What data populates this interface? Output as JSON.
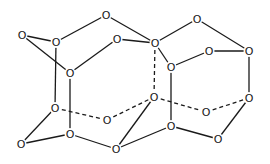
{
  "diagram": {
    "type": "molecular-structure",
    "atom_label": "O",
    "colors": {
      "line": "#1a1a1a",
      "background": "#ffffff"
    },
    "atoms": [
      {
        "id": 0,
        "label": "O",
        "x": 22,
        "y": 35
      },
      {
        "id": 1,
        "label": "O",
        "x": 56,
        "y": 42
      },
      {
        "id": 2,
        "label": "O",
        "x": 106,
        "y": 15
      },
      {
        "id": 3,
        "label": "O",
        "x": 117,
        "y": 39
      },
      {
        "id": 4,
        "label": "O",
        "x": 155,
        "y": 43
      },
      {
        "id": 5,
        "label": "O",
        "x": 197,
        "y": 19
      },
      {
        "id": 6,
        "label": "O",
        "x": 209,
        "y": 51
      },
      {
        "id": 7,
        "label": "O",
        "x": 249,
        "y": 51
      },
      {
        "id": 8,
        "label": "O",
        "x": 70,
        "y": 73
      },
      {
        "id": 9,
        "label": "O",
        "x": 171,
        "y": 67
      },
      {
        "id": 10,
        "label": "O",
        "x": 55,
        "y": 108
      },
      {
        "id": 11,
        "label": "O",
        "x": 107,
        "y": 120
      },
      {
        "id": 12,
        "label": "O",
        "x": 154,
        "y": 97
      },
      {
        "id": 13,
        "label": "O",
        "x": 206,
        "y": 112
      },
      {
        "id": 14,
        "label": "O",
        "x": 249,
        "y": 98
      },
      {
        "id": 15,
        "label": "O",
        "x": 21,
        "y": 144
      },
      {
        "id": 16,
        "label": "O",
        "x": 70,
        "y": 134
      },
      {
        "id": 17,
        "label": "O",
        "x": 116,
        "y": 149
      },
      {
        "id": 18,
        "label": "O",
        "x": 171,
        "y": 126
      },
      {
        "id": 19,
        "label": "O",
        "x": 218,
        "y": 139
      }
    ],
    "bonds": [
      {
        "a": 0,
        "b": 1,
        "style": "solid"
      },
      {
        "a": 0,
        "b": 8,
        "style": "solid"
      },
      {
        "a": 1,
        "b": 2,
        "style": "solid"
      },
      {
        "a": 8,
        "b": 3,
        "style": "solid"
      },
      {
        "a": 2,
        "b": 4,
        "style": "solid"
      },
      {
        "a": 3,
        "b": 4,
        "style": "solid"
      },
      {
        "a": 4,
        "b": 5,
        "style": "solid"
      },
      {
        "a": 4,
        "b": 9,
        "style": "solid"
      },
      {
        "a": 9,
        "b": 6,
        "style": "solid"
      },
      {
        "a": 5,
        "b": 7,
        "style": "solid"
      },
      {
        "a": 6,
        "b": 7,
        "style": "solid"
      },
      {
        "a": 7,
        "b": 14,
        "style": "solid"
      },
      {
        "a": 1,
        "b": 10,
        "style": "solid"
      },
      {
        "a": 8,
        "b": 16,
        "style": "solid"
      },
      {
        "a": 9,
        "b": 18,
        "style": "solid"
      },
      {
        "a": 10,
        "b": 15,
        "style": "solid"
      },
      {
        "a": 15,
        "b": 16,
        "style": "solid"
      },
      {
        "a": 16,
        "b": 17,
        "style": "solid"
      },
      {
        "a": 17,
        "b": 12,
        "style": "solid"
      },
      {
        "a": 17,
        "b": 18,
        "style": "solid"
      },
      {
        "a": 18,
        "b": 19,
        "style": "solid"
      },
      {
        "a": 19,
        "b": 14,
        "style": "solid"
      },
      {
        "a": 4,
        "b": 12,
        "style": "dashed"
      },
      {
        "a": 10,
        "b": 11,
        "style": "dashed"
      },
      {
        "a": 11,
        "b": 12,
        "style": "dashed"
      },
      {
        "a": 12,
        "b": 13,
        "style": "dashed"
      },
      {
        "a": 13,
        "b": 14,
        "style": "dashed"
      }
    ]
  }
}
